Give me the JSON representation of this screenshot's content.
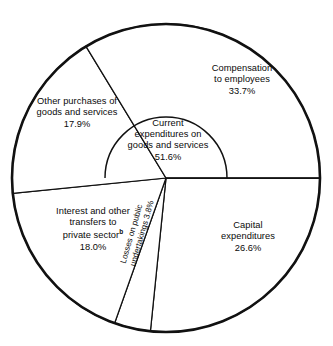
{
  "chart_data": {
    "type": "pie",
    "title": "",
    "subtitle": "",
    "xlabel": "",
    "ylabel": "",
    "legend_position": "none",
    "grid": false,
    "units": "percent",
    "total": 100.0,
    "categories": [
      "Compensation to employees",
      "Other purchases of goods and services",
      "Interest and other transfers to private sector",
      "Losses on public undertakings",
      "Capital expenditures"
    ],
    "values": [
      33.7,
      17.9,
      18.0,
      3.8,
      26.6
    ],
    "slices": [
      {
        "name": "compensation-to-employees",
        "label_lines": [
          "Compensation",
          "to employees"
        ],
        "value": 33.7,
        "value_text": "33.7%",
        "start_angle": 0.0,
        "end_angle": 121.3,
        "color": "#ffffff"
      },
      {
        "name": "other-purchases-of-goods-and-services",
        "label_lines": [
          "Other purchases of",
          "goods and services"
        ],
        "value": 17.9,
        "value_text": "17.9%",
        "start_angle": 121.3,
        "end_angle": 185.7,
        "color": "#ffffff"
      },
      {
        "name": "interest-and-other-transfers-to-private-sector",
        "label_lines": [
          "Interest and other",
          "transfers to",
          "private sector"
        ],
        "footnote_marker": "b",
        "value": 18.0,
        "value_text": "18.0%",
        "start_angle": 185.7,
        "end_angle": 250.5,
        "color": "#ffffff"
      },
      {
        "name": "losses-on-public-undertakings",
        "label_lines": [
          "Losses on public",
          "undertakings 3.8%"
        ],
        "value": 3.8,
        "value_text": "3.8%",
        "start_angle": 250.5,
        "end_angle": 264.2,
        "color": "#ffffff"
      },
      {
        "name": "capital-expenditures",
        "label_lines": [
          "Capital",
          "expenditures"
        ],
        "value": 26.6,
        "value_text": "26.6%",
        "start_angle": 264.2,
        "end_angle": 360.0,
        "color": "#ffffff"
      }
    ],
    "inner_group": {
      "name": "current-expenditures-on-goods-and-services",
      "label_lines": [
        "Current",
        "expenditures on",
        "goods and services"
      ],
      "value": 51.6,
      "value_text": "51.6%",
      "components": [
        "Compensation to employees",
        "Other purchases of goods and services"
      ],
      "start_angle": 0.0,
      "end_angle": 180.0
    },
    "geometry": {
      "center_x": 166,
      "center_y": 178,
      "outer_radius": 154,
      "inner_radius": 61
    },
    "colors": {
      "stroke": "#111111",
      "fill": "#ffffff",
      "text": "#0a0a0a",
      "background": "#ffffff"
    }
  },
  "labels": {
    "compensation": {
      "line1": "Compensation",
      "line2": "to employees",
      "pct": "33.7%"
    },
    "other_purchases": {
      "line1": "Other purchases of",
      "line2": "goods and services",
      "pct": "17.9%"
    },
    "current_expenditures": {
      "line1": "Current",
      "line2": "expenditures on",
      "line3": "goods and services",
      "pct": "51.6%"
    },
    "interest": {
      "line1": "Interest and other",
      "line2": "transfers to",
      "line3": "private sector",
      "footnote": "b",
      "pct": "18.0%"
    },
    "losses": {
      "line1": "Losses on public",
      "line2": "undertakings 3.8%"
    },
    "capital": {
      "line1": "Capital",
      "line2": "expenditures",
      "pct": "26.6%"
    }
  }
}
